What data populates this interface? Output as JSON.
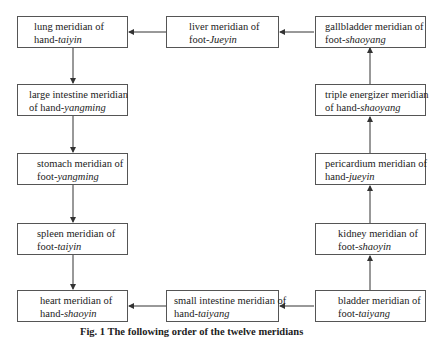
{
  "diagram": {
    "type": "flowchart",
    "nodes": [
      {
        "id": "lung",
        "line1": "lung meridian of",
        "line2_prefix": "hand-",
        "line2_italic": "taiyin"
      },
      {
        "id": "large_intestine",
        "line1": "large intestine meridian",
        "line2_prefix": "of hand-",
        "line2_italic": "yangming"
      },
      {
        "id": "stomach",
        "line1": "stomach meridian of",
        "line2_prefix": "foot-",
        "line2_italic": "yangming"
      },
      {
        "id": "spleen",
        "line1": "spleen meridian of",
        "line2_prefix": "foot-",
        "line2_italic": "taiyin"
      },
      {
        "id": "heart",
        "line1": "heart meridian of",
        "line2_prefix": "hand-",
        "line2_italic": "shaoyin"
      },
      {
        "id": "small_intestine",
        "line1": "small intestine meridian of",
        "line2_prefix": "hand-",
        "line2_italic": "taiyang"
      },
      {
        "id": "bladder",
        "line1": "bladder meridian of",
        "line2_prefix": "foot-",
        "line2_italic": "taiyang"
      },
      {
        "id": "kidney",
        "line1": "kidney meridian of",
        "line2_prefix": "foot-",
        "line2_italic": "shaoyin"
      },
      {
        "id": "pericardium",
        "line1": "pericardium meridian of",
        "line2_prefix": "hand-",
        "line2_italic": "jueyin"
      },
      {
        "id": "triple_energizer",
        "line1": "triple energizer meridian",
        "line2_prefix": "of hand-",
        "line2_italic": "shaoyang"
      },
      {
        "id": "gallbladder",
        "line1": "gallbladder meridian of",
        "line2_prefix": "foot-",
        "line2_italic": "shaoyang"
      },
      {
        "id": "liver",
        "line1": "liver meridian of",
        "line2_prefix": "foot-",
        "line2_italic": "Jueyin"
      }
    ],
    "edges": [
      {
        "from": "lung",
        "to": "large_intestine"
      },
      {
        "from": "large_intestine",
        "to": "stomach"
      },
      {
        "from": "stomach",
        "to": "spleen"
      },
      {
        "from": "spleen",
        "to": "heart"
      },
      {
        "from": "small_intestine",
        "to": "heart"
      },
      {
        "from": "bladder",
        "to": "small_intestine"
      },
      {
        "from": "bladder",
        "to": "kidney"
      },
      {
        "from": "kidney",
        "to": "pericardium"
      },
      {
        "from": "pericardium",
        "to": "triple_energizer"
      },
      {
        "from": "triple_energizer",
        "to": "gallbladder"
      },
      {
        "from": "gallbladder",
        "to": "liver"
      },
      {
        "from": "liver",
        "to": "lung"
      }
    ],
    "caption": "Fig. 1   The following order of the twelve meridians"
  },
  "colors": {
    "border": "#555555",
    "arrow": "#333333",
    "text": "#222222",
    "background": "#ffffff"
  }
}
